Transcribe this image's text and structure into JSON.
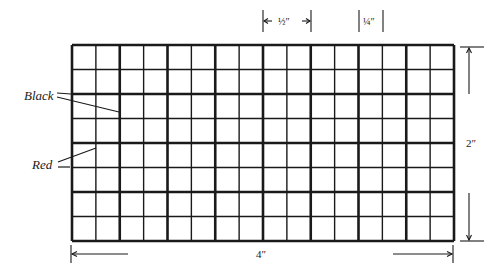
{
  "diagram": {
    "grid": {
      "left": 72,
      "top": 45,
      "right": 454,
      "bottom": 241,
      "major_cols": 8,
      "major_rows": 4,
      "subdivisions": 2,
      "major_stroke": 2.6,
      "minor_stroke": 1.4,
      "color": "#1a1a1a"
    },
    "labels": {
      "black": "Black",
      "red": "Red",
      "half_inch": "½″",
      "quarter_inch": "¼″",
      "height": "2″",
      "width": "4″"
    }
  }
}
